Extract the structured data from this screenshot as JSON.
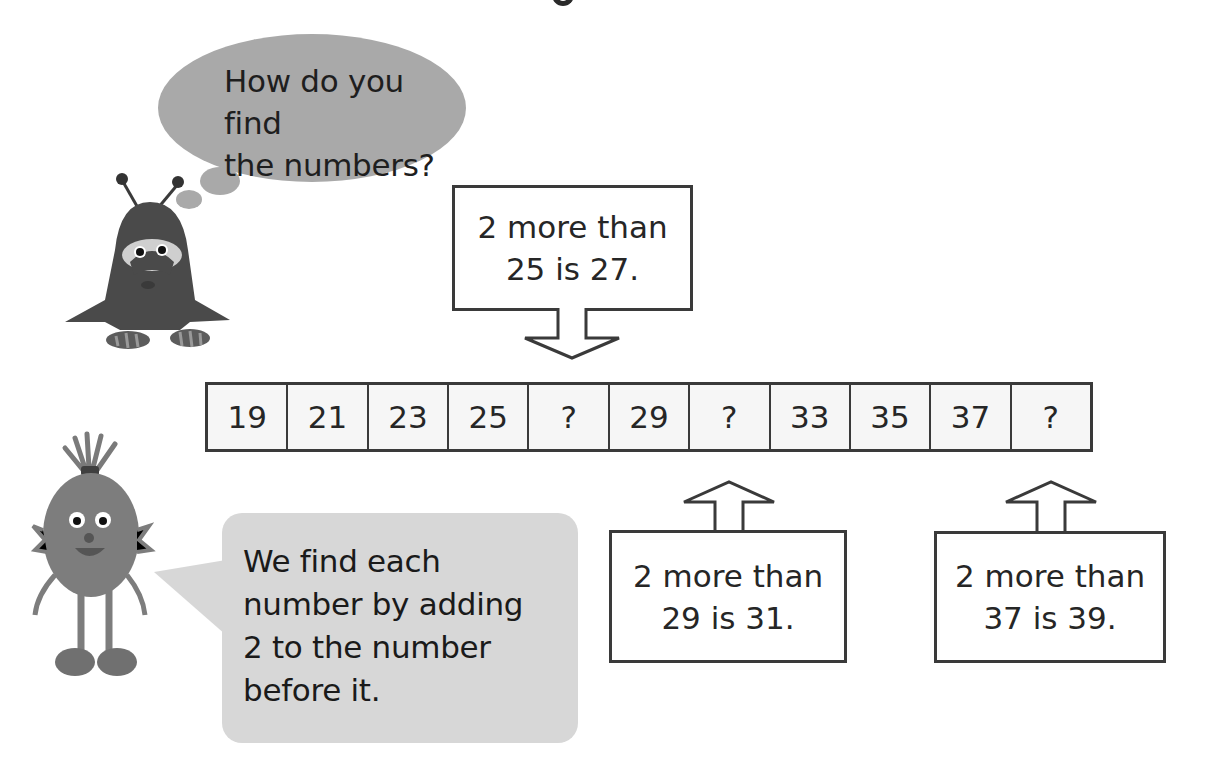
{
  "heading_fragment": "g",
  "thought_bubble": {
    "speaker": "dark-furry-monster",
    "lines": [
      "How do you find",
      "the numbers?"
    ]
  },
  "top_box": {
    "lines": [
      "2 more than",
      "25 is 27."
    ],
    "arrow_direction": "down",
    "points_to_cell_index": 4
  },
  "number_strip": {
    "cells": [
      "19",
      "21",
      "23",
      "25",
      "?",
      "29",
      "?",
      "33",
      "35",
      "37",
      "?"
    ]
  },
  "middle_box": {
    "lines": [
      "2 more than",
      "29 is 31."
    ],
    "arrow_direction": "up",
    "points_to_cell_index": 6
  },
  "right_box": {
    "lines": [
      "2 more than",
      "37 is 39."
    ],
    "arrow_direction": "up",
    "points_to_cell_index": 10
  },
  "speech_bubble": {
    "speaker": "fuzzy-orange-monster",
    "lines": [
      "We find each",
      "number by adding",
      "2 to the number",
      "before it."
    ]
  },
  "colors": {
    "thought_bubble": "#a9a9a9",
    "speech_bubble": "#d7d7d7",
    "border": "#3a3a3a",
    "text": "#262626",
    "cell_bg": "#f6f6f6"
  }
}
